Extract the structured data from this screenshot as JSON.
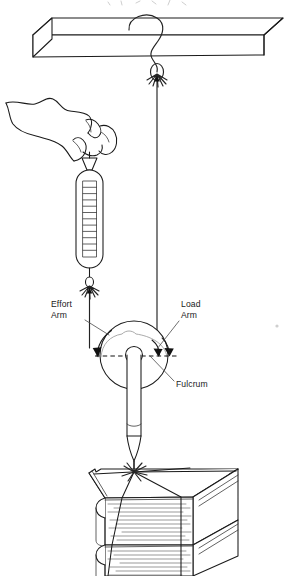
{
  "figure": {
    "top_cut_text": "",
    "labels": {
      "effort_arm_line1": "Effort",
      "effort_arm_line2": "Arm",
      "load_arm_line1": "Load",
      "load_arm_line2": "Arm",
      "fulcrum": "Fulcrum"
    },
    "parts": {
      "beam": "overhead-beam",
      "hand": "hand-gripping",
      "spring_scale": "spring-scale",
      "spring_scale_divisions": 12,
      "wheel": "wheel-disc",
      "shaft": "screwdriver-shaft",
      "books": "book-stack",
      "book_count": 2,
      "knots": 3,
      "load_string": "load-string",
      "effort_string": "effort-string"
    },
    "colors": {
      "ink": "#1a1a1a",
      "pale_ink": "#8d8d8d",
      "page_lines": "#6e6e6e",
      "background": "#ffffff"
    }
  }
}
